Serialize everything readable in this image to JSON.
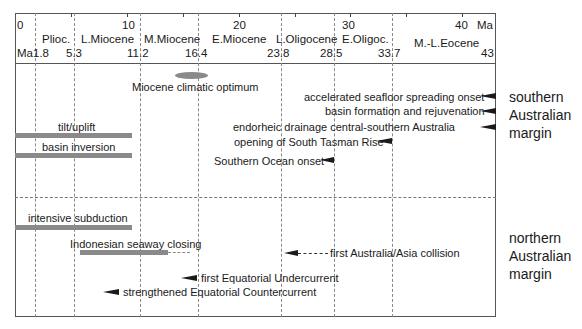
{
  "axis": {
    "unit_top": "Ma",
    "unit_bottom": "Ma",
    "top_ticks": [
      {
        "label": "0",
        "x": 17
      },
      {
        "label": "10",
        "x": 122
      },
      {
        "label": "20",
        "x": 233
      },
      {
        "label": "30",
        "x": 340
      },
      {
        "label": "40",
        "x": 453
      }
    ],
    "boundaries": [
      {
        "label": "1.8",
        "x": 35
      },
      {
        "label": "5.3",
        "x": 74
      },
      {
        "label": "11.2",
        "x": 140
      },
      {
        "label": "16.4",
        "x": 198
      },
      {
        "label": "23.8",
        "x": 281
      },
      {
        "label": "28.5",
        "x": 334
      },
      {
        "label": "33.7",
        "x": 392
      },
      {
        "label": "43",
        "x": 496
      }
    ],
    "epochs": [
      {
        "label": "Plioc.",
        "x": 40
      },
      {
        "label": "L.Miocene",
        "x": 80
      },
      {
        "label": "M.Miocene",
        "x": 143
      },
      {
        "label": "E.Miocene",
        "x": 212
      },
      {
        "label": "L.Oligocene",
        "x": 276
      },
      {
        "label": "E.Oligoc.",
        "x": 341
      },
      {
        "label": "M.-L.Eocene",
        "x": 414
      }
    ]
  },
  "southern": {
    "region_label": [
      "southern",
      "Australian",
      "margin"
    ],
    "events": {
      "miocene_optimum": "Miocene climatic optimum",
      "seafloor": "accelerated seafloor spreading onset",
      "basin_formation": "basin formation and rejuvenation",
      "endorheic": "endorheic drainage central-southern Australia",
      "tasman": "opening of South Tasman Rise",
      "southern_ocean": "Southern Ocean onset",
      "tilt": "tilt/uplift",
      "inversion": "basin inversion"
    }
  },
  "northern": {
    "region_label": [
      "northern",
      "Australian",
      "margin"
    ],
    "events": {
      "subduction": "intensive subduction",
      "seaway": "Indonesian seaway closing",
      "collision": "first Australia/Asia collision",
      "undercurrent": "first Equatorial Undercurrent",
      "countercurrent": "strengthened Equatorial Countercurrent"
    }
  },
  "colors": {
    "bar": "#8a8a8a",
    "arrow": "#1a1a1a",
    "frame": "#555555"
  }
}
